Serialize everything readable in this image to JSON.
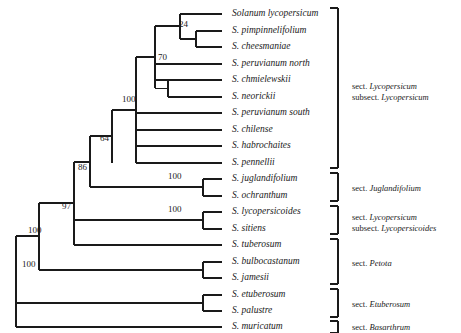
{
  "figure": {
    "type": "phylogenetic-cladogram",
    "width": 461,
    "height": 333,
    "line_color": "#1a1a1a",
    "background": "#ffffff"
  },
  "tips": [
    {
      "id": "lycopersicum",
      "label": "Solanum lycopersicum",
      "y": 14
    },
    {
      "id": "pimpinnelifolium",
      "label": "S. pimpinnelifolium",
      "y": 31
    },
    {
      "id": "cheesmaniae",
      "label": "S. cheesmaniae",
      "y": 47
    },
    {
      "id": "peruvianum_north",
      "label": "S. peruvianum north",
      "y": 64
    },
    {
      "id": "chmielewskii",
      "label": "S. chmielewskii",
      "y": 80
    },
    {
      "id": "neorickii",
      "label": "S. neorickii",
      "y": 97
    },
    {
      "id": "peruvianum_south",
      "label": "S. peruvianum south",
      "y": 113
    },
    {
      "id": "chilense",
      "label": "S. chilense",
      "y": 130
    },
    {
      "id": "habrochaites",
      "label": "S. habrochaites",
      "y": 146
    },
    {
      "id": "pennellii",
      "label": "S. pennellii",
      "y": 163
    },
    {
      "id": "juglandifolium",
      "label": "S. juglandifolium",
      "y": 179
    },
    {
      "id": "ochranthum",
      "label": "S. ochranthum",
      "y": 196
    },
    {
      "id": "lycopersicoides",
      "label": "S. lycopersicoides",
      "y": 212
    },
    {
      "id": "sitiens",
      "label": "S. sitiens",
      "y": 229
    },
    {
      "id": "tuberosum",
      "label": "S. tuberosum",
      "y": 245
    },
    {
      "id": "bulbocastanum",
      "label": "S. bulbocastanum",
      "y": 262
    },
    {
      "id": "jamesii",
      "label": "S. jamesii",
      "y": 278
    },
    {
      "id": "etuberosum",
      "label": "S. etuberosum",
      "y": 295
    },
    {
      "id": "palustre",
      "label": "S. palustre",
      "y": 311
    },
    {
      "id": "muricatum",
      "label": "S. muricatum",
      "y": 327
    }
  ],
  "tip_label_x": 232,
  "tip_tick_x": 222,
  "nodes": [
    {
      "id": "n_24",
      "x": 196,
      "y_top": 31,
      "y_bottom": 47,
      "children_x": 222,
      "support": "24",
      "label_x": 179,
      "label_y": 20
    },
    {
      "id": "n_lyc3",
      "x": 180,
      "y_top": 14,
      "y_bottom": 39,
      "children_x": 196,
      "support": null,
      "label_x": null,
      "label_y": null
    },
    {
      "id": "n_chm",
      "x": 168,
      "y_top": 80,
      "y_bottom": 97,
      "children_x": 222,
      "support": null,
      "label_x": null,
      "label_y": null
    },
    {
      "id": "n_70",
      "x": 155,
      "y_top": 26,
      "y_bottom": 113,
      "children_x": 222,
      "support": "70",
      "label_x": 158,
      "label_y": 53
    },
    {
      "id": "n_100a",
      "x": 136,
      "y_top": 61,
      "y_bottom": 163,
      "children_x": 222,
      "support": "100",
      "label_x": 122,
      "label_y": 95
    },
    {
      "id": "n_64",
      "x": 112,
      "y_top": 112,
      "y_bottom": 196,
      "children_x": 222,
      "support": "64",
      "label_x": 100,
      "label_y": 134
    },
    {
      "id": "n_jug",
      "x": 203,
      "y_top": 179,
      "y_bottom": 196,
      "children_x": 222,
      "support": "100",
      "label_x": 168,
      "label_y": 172
    },
    {
      "id": "n_86",
      "x": 90,
      "y_top": 154,
      "y_bottom": 229,
      "children_x": 203,
      "support": "86",
      "label_x": 78,
      "label_y": 163
    },
    {
      "id": "n_lyd",
      "x": 203,
      "y_top": 212,
      "y_bottom": 229,
      "children_x": 222,
      "support": "100",
      "label_x": 168,
      "label_y": 205
    },
    {
      "id": "n_97",
      "x": 74,
      "y_top": 191,
      "y_bottom": 245,
      "children_x": 222,
      "support": "97",
      "label_x": 62,
      "label_y": 202
    },
    {
      "id": "n_bul",
      "x": 203,
      "y_top": 262,
      "y_bottom": 278,
      "children_x": 222,
      "support": null,
      "label_x": null,
      "label_y": null
    },
    {
      "id": "n_100b",
      "x": 39,
      "y_top": 218,
      "y_bottom": 270,
      "children_x": 203,
      "support": "100",
      "label_x": 28,
      "label_y": 226
    },
    {
      "id": "n_etu",
      "x": 203,
      "y_top": 295,
      "y_bottom": 311,
      "children_x": 222,
      "support": null,
      "label_x": null,
      "label_y": null
    },
    {
      "id": "n_root",
      "x": 16,
      "y_top": 244,
      "y_bottom": 327,
      "children_x": 203,
      "support": "100",
      "label_x": 22,
      "label_y": 260
    }
  ],
  "brackets": [
    {
      "id": "bracket-lycopersicum",
      "x": 338,
      "y_top": 8,
      "y_bottom": 168,
      "tick": 8,
      "lines": [
        {
          "rank": "sect.",
          "epithet": "Lycopersicum"
        },
        {
          "rank": "subsect.",
          "epithet": "Lycopersicum"
        }
      ],
      "text_x": 352,
      "text_y": 81
    },
    {
      "id": "bracket-juglandifolium",
      "x": 338,
      "y_top": 173,
      "y_bottom": 201,
      "tick": 8,
      "lines": [
        {
          "rank": "sect.",
          "epithet": "Juglandifolium"
        }
      ],
      "text_x": 352,
      "text_y": 183
    },
    {
      "id": "bracket-lycopersicoides",
      "x": 338,
      "y_top": 206,
      "y_bottom": 234,
      "tick": 8,
      "lines": [
        {
          "rank": "sect.",
          "epithet": "Lycopersicum"
        },
        {
          "rank": "subsect.",
          "epithet": "Lycopersicoides"
        }
      ],
      "text_x": 352,
      "text_y": 212
    },
    {
      "id": "bracket-petota",
      "x": 338,
      "y_top": 239,
      "y_bottom": 284,
      "tick": 8,
      "lines": [
        {
          "rank": "sect.",
          "epithet": "Petota"
        }
      ],
      "text_x": 352,
      "text_y": 258
    },
    {
      "id": "bracket-etuberosum",
      "x": 338,
      "y_top": 289,
      "y_bottom": 317,
      "tick": 8,
      "lines": [
        {
          "rank": "sect.",
          "epithet": "Etuberosum"
        }
      ],
      "text_x": 352,
      "text_y": 299
    },
    {
      "id": "bracket-basarthrum",
      "x": 338,
      "y_top": 321,
      "y_bottom": 333,
      "tick": 8,
      "lines": [
        {
          "rank": "sect.",
          "epithet": "Basarthrum"
        }
      ],
      "text_x": 352,
      "text_y": 322
    }
  ],
  "chart_data": {
    "type": "table",
    "title": "",
    "taxa": [
      "Solanum lycopersicum",
      "S. pimpinnelifolium",
      "S. cheesmaniae",
      "S. peruvianum north",
      "S. chmielewskii",
      "S. neorickii",
      "S. peruvianum south",
      "S. chilense",
      "S. habrochaites",
      "S. pennellii",
      "S. juglandifolium",
      "S. ochranthum",
      "S. lycopersicoides",
      "S. sitiens",
      "S. tuberosum",
      "S. bulbocastanum",
      "S. jamesii",
      "S. etuberosum",
      "S. palustre",
      "S. muricatum"
    ],
    "support_values": [
      24,
      70,
      100,
      64,
      100,
      86,
      100,
      97,
      100,
      100
    ],
    "sections": [
      "sect. Lycopersicum subsect. Lycopersicum",
      "sect. Juglandifolium",
      "sect. Lycopersicum subsect. Lycopersicoides",
      "sect. Petota",
      "sect. Etuberosum",
      "sect. Basarthrum"
    ]
  }
}
